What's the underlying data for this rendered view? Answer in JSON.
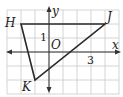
{
  "diagram": {
    "type": "coordinate-plane-triangle",
    "grid": {
      "x_min": -3,
      "x_max": 5,
      "y_min": -3,
      "y_max": 3,
      "unit_px": 14,
      "origin_px": [
        49,
        52
      ]
    },
    "axes": {
      "x_label": "x",
      "y_label": "y",
      "origin_label": "O"
    },
    "tick_labels": [
      {
        "axis": "y",
        "value": 1,
        "text": "1"
      },
      {
        "axis": "x",
        "value": 3,
        "text": "3"
      }
    ],
    "triangle": {
      "vertices": [
        {
          "name": "H",
          "x": -2,
          "y": 2
        },
        {
          "name": "J",
          "x": 4,
          "y": 2
        },
        {
          "name": "K",
          "x": -1,
          "y": -2
        }
      ]
    },
    "colors": {
      "grid": "#c9c9c9",
      "axis": "#333333",
      "triangle": "#2a2a2a"
    }
  },
  "labels": {
    "H": "H",
    "J": "J",
    "K": "K",
    "x": "x",
    "y": "y",
    "O": "O",
    "one": "1",
    "three": "3"
  }
}
